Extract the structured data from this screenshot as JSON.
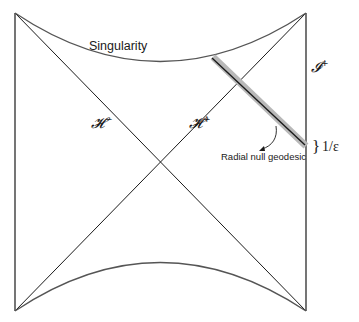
{
  "figure": {
    "labels": {
      "singularity": "Singularity",
      "horizon_past": "𝓗",
      "horizon_past_sup": "−",
      "horizon_future": "𝓗",
      "horizon_future_sup": "+",
      "scri_plus": "𝓘",
      "scri_plus_sup": "+",
      "geodesic": "Radial null geodesic",
      "width_brace": "}",
      "width_label": "1/ε"
    },
    "colors": {
      "line": "#1a1a1a",
      "curve": "#555555",
      "geodesic_band": "#b8b8b8",
      "geodesic_core": "#1a1a1a"
    }
  }
}
